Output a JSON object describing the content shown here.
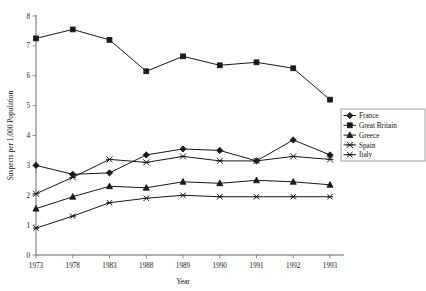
{
  "chart_data": {
    "type": "line",
    "title": "",
    "xlabel": "Year",
    "ylabel": "Suspects per 1,000 Population",
    "categories": [
      "1973",
      "1978",
      "1983",
      "1988",
      "1989",
      "1990",
      "1991",
      "1992",
      "1993"
    ],
    "x": [
      1973,
      1978,
      1983,
      1988,
      1989,
      1990,
      1991,
      1992,
      1993
    ],
    "ylim": [
      0,
      8
    ],
    "xlim_note": "categorical evenly spaced",
    "yticks": [
      0,
      1,
      2,
      3,
      4,
      5,
      6,
      7,
      8
    ],
    "ytick_labels": [
      "0",
      "1",
      "2",
      "3",
      "4",
      "5",
      "6",
      "7",
      "8"
    ],
    "grid": false,
    "legend_position": "right-outside",
    "series": [
      {
        "name": "France",
        "marker": "diamond",
        "values": [
          3.0,
          2.7,
          2.75,
          3.35,
          3.55,
          3.5,
          3.15,
          3.85,
          3.35
        ]
      },
      {
        "name": "Great Britain",
        "marker": "square",
        "values": [
          7.25,
          7.55,
          7.2,
          6.15,
          6.65,
          6.35,
          6.45,
          6.25,
          5.2
        ]
      },
      {
        "name": "Greece",
        "marker": "triangle",
        "values": [
          1.55,
          1.95,
          2.3,
          2.25,
          2.45,
          2.4,
          2.5,
          2.45,
          2.35
        ]
      },
      {
        "name": "Spain",
        "marker": "x",
        "values": [
          2.05,
          2.6,
          3.2,
          3.1,
          3.3,
          3.15,
          3.15,
          3.3,
          3.2
        ]
      },
      {
        "name": "Italy",
        "marker": "x-thin",
        "values": [
          0.9,
          1.3,
          1.75,
          1.9,
          2.0,
          1.95,
          1.95,
          1.95,
          1.95
        ]
      }
    ]
  },
  "legend": {
    "items": [
      {
        "label": "France"
      },
      {
        "label": "Great Britain"
      },
      {
        "label": "Greece"
      },
      {
        "label": "Spain"
      },
      {
        "label": "Italy"
      }
    ]
  },
  "axes": {
    "x_title": "Year",
    "y_title": "Suspects per 1,000 Population"
  }
}
